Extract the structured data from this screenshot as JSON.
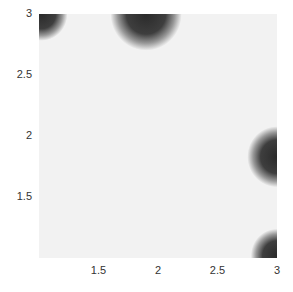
{
  "chart_data": {
    "type": "heatmap",
    "title": "",
    "xlabel": "",
    "ylabel": "",
    "xlim": [
      1.0,
      3.0
    ],
    "ylim": [
      1.0,
      3.0
    ],
    "grid": false,
    "legend": null,
    "colormap": "gray (dark = high intensity)",
    "background_value_color": "#f2f2f2",
    "peak_color": "#2a2a2a",
    "x_ticks": [
      "1.5",
      "2",
      "2.5",
      "3"
    ],
    "y_ticks": [
      "3",
      "2.5",
      "2",
      "1.5"
    ],
    "blobs": [
      {
        "x": 1.02,
        "y": 3.0,
        "radius": 0.22
      },
      {
        "x": 1.9,
        "y": 3.0,
        "radius": 0.3
      },
      {
        "x": 3.0,
        "y": 1.83,
        "radius": 0.25
      },
      {
        "x": 3.0,
        "y": 1.02,
        "radius": 0.22
      }
    ]
  },
  "axes": {
    "x_ticks": [
      {
        "label": "1.5",
        "value": 1.5
      },
      {
        "label": "2",
        "value": 2.0
      },
      {
        "label": "2.5",
        "value": 2.5
      },
      {
        "label": "3",
        "value": 3.0
      }
    ],
    "y_ticks": [
      {
        "label": "3",
        "value": 3.0
      },
      {
        "label": "2.5",
        "value": 2.5
      },
      {
        "label": "2",
        "value": 2.0
      },
      {
        "label": "1.5",
        "value": 1.5
      }
    ]
  }
}
